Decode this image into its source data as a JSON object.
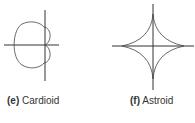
{
  "figures": [
    {
      "id": "e",
      "label_letter": "(e)",
      "label_text": "Cardioid"
    },
    {
      "id": "f",
      "label_letter": "(f)",
      "label_text": "Astroid"
    }
  ],
  "colors": {
    "curve": "#444444",
    "axis": "#333333",
    "text": "#333333"
  }
}
